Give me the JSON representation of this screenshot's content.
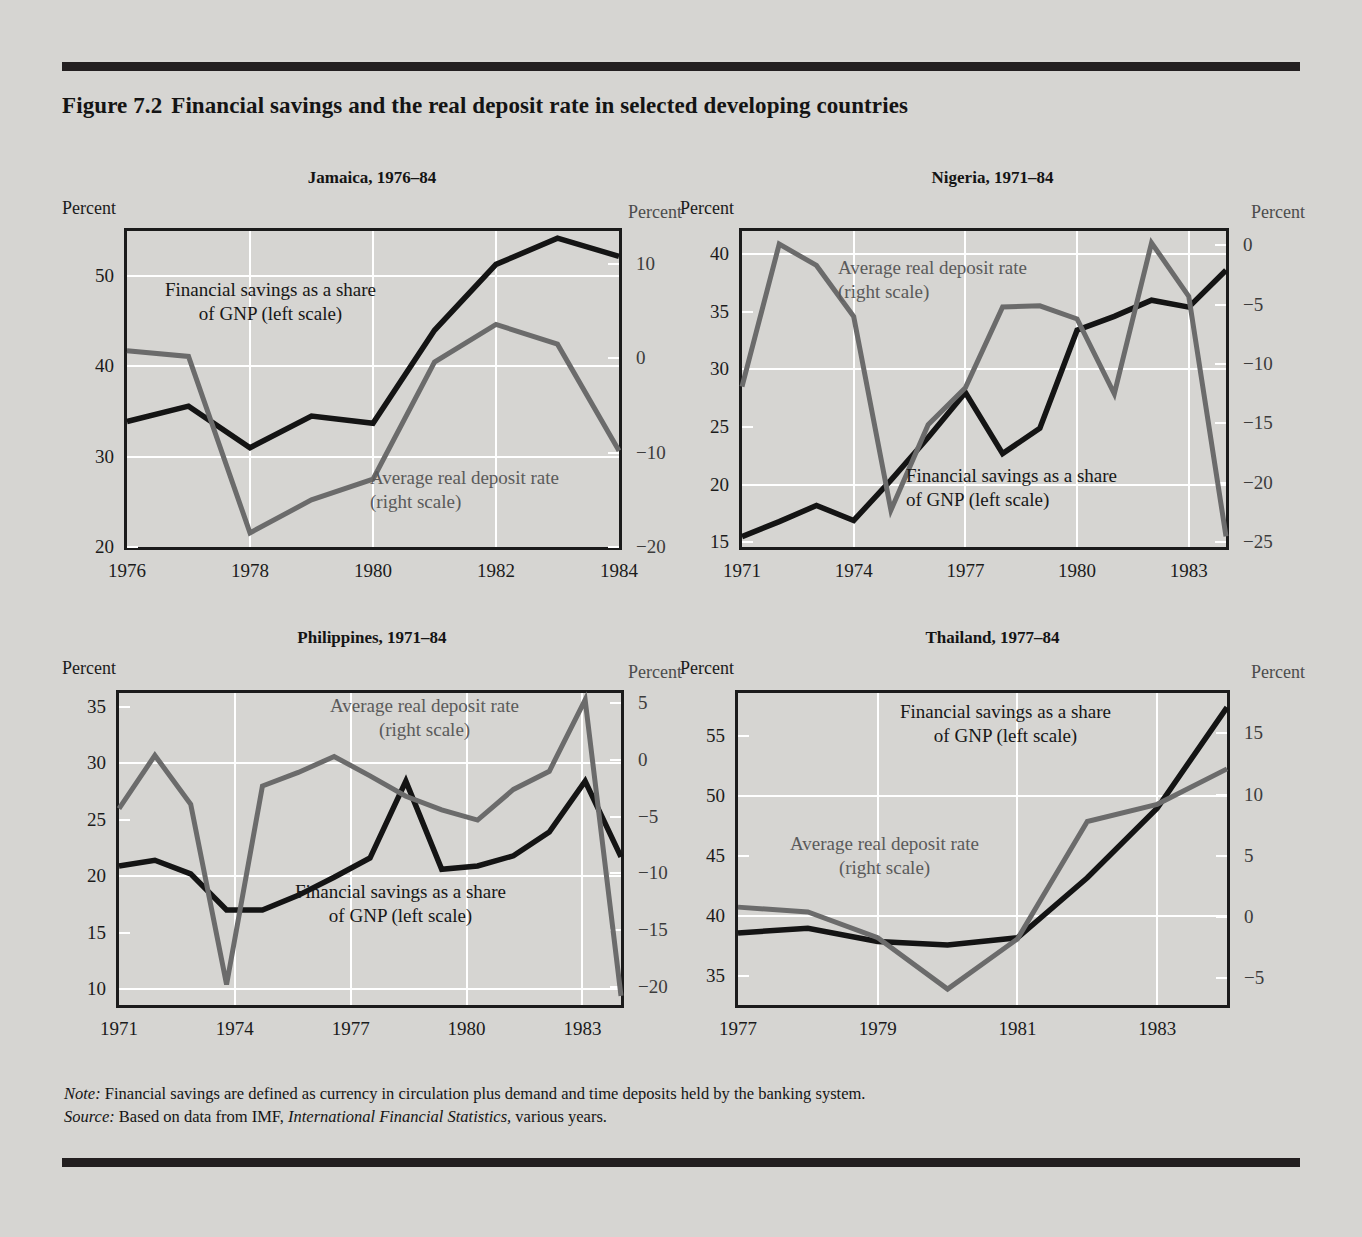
{
  "figure": {
    "number": "Figure 7.2",
    "title": "Financial savings and the real deposit rate in selected developing countries"
  },
  "axis_caption": {
    "left": "Percent",
    "right": "Percent"
  },
  "legend": {
    "savings_line1": "Financial savings as a share",
    "savings_line2": "of GNP (left scale)",
    "deposit_line1": "Average real deposit rate",
    "deposit_line2": "(right scale)"
  },
  "note": {
    "note_label": "Note:",
    "note_text": " Financial savings are defined as currency in circulation plus demand and time deposits held by the banking system.",
    "source_label": "Source:",
    "source_text_a": " Based on data from IMF, ",
    "source_italic": "International Financial Statistics,",
    "source_text_b": " various years."
  },
  "colors": {
    "background": "#d6d5d2",
    "savings_line": "#141414",
    "deposit_line": "#6b6b6b",
    "gridline": "#ffffff",
    "axis": "#1b1b1b"
  },
  "chart_data": [
    {
      "type": "line",
      "id": "jamaica",
      "title": "Jamaica, 1976–84",
      "xlabel": "",
      "ylabel": "Percent",
      "y2label": "Percent",
      "x": [
        1976,
        1977,
        1978,
        1979,
        1980,
        1981,
        1982,
        1983,
        1984
      ],
      "xlim": [
        1976,
        1984
      ],
      "xticks": [
        1976,
        1978,
        1980,
        1982,
        1984
      ],
      "xticklabels": [
        "1976",
        "1978",
        "1980",
        "1982",
        "1984"
      ],
      "ylim": [
        20,
        55
      ],
      "yticks": [
        20,
        30,
        40,
        50
      ],
      "yticklabels": [
        "20",
        "30",
        "40",
        "50"
      ],
      "ygrid": [
        30,
        40,
        50
      ],
      "y2lim": [
        -20,
        13.5
      ],
      "y2ticks": [
        -20,
        -10,
        0,
        10
      ],
      "y2ticklabels": [
        "−20",
        "−10",
        "0",
        "10"
      ],
      "grid": true,
      "series": [
        {
          "name": "Financial savings as a share of GNP (left scale)",
          "axis": "left",
          "color": "#141414",
          "values": [
            33.9,
            35.6,
            31.0,
            34.5,
            33.7,
            44.0,
            51.3,
            54.2,
            52.2
          ]
        },
        {
          "name": "Average real deposit rate (right scale)",
          "axis": "right",
          "color": "#6b6b6b",
          "values": [
            0.8,
            0.2,
            -18.5,
            -15.0,
            -12.8,
            -0.4,
            3.6,
            1.5,
            -9.8
          ]
        }
      ],
      "annotations": [
        {
          "text": "Financial savings as a share / of GNP (left scale)",
          "style": "dark"
        },
        {
          "text": "Average real deposit rate / (right scale)",
          "style": "gray"
        }
      ]
    },
    {
      "type": "line",
      "id": "nigeria",
      "title": "Nigeria, 1971–84",
      "xlabel": "",
      "ylabel": "Percent",
      "y2label": "Percent",
      "x": [
        1971,
        1972,
        1973,
        1974,
        1975,
        1976,
        1977,
        1978,
        1979,
        1980,
        1981,
        1982,
        1983,
        1984
      ],
      "xlim": [
        1971,
        1984
      ],
      "xticks": [
        1971,
        1974,
        1977,
        1980,
        1983
      ],
      "xticklabels": [
        "1971",
        "1974",
        "1977",
        "1980",
        "1983"
      ],
      "ylim": [
        14.6,
        42
      ],
      "yticks": [
        15,
        20,
        25,
        30,
        35,
        40
      ],
      "yticklabels": [
        "15",
        "20",
        "25",
        "30",
        "35",
        "40"
      ],
      "ygrid": [
        20,
        30,
        40
      ],
      "y2lim": [
        -25.4,
        1.2
      ],
      "y2ticks": [
        -25,
        -20,
        -15,
        -10,
        -5,
        0
      ],
      "y2ticklabels": [
        "−25",
        "−20",
        "−15",
        "−10",
        "−5",
        "0"
      ],
      "grid": true,
      "series": [
        {
          "name": "Financial savings as a share of GNP (left scale)",
          "axis": "left",
          "color": "#141414",
          "values": [
            15.5,
            16.8,
            18.2,
            16.9,
            20.4,
            24.1,
            28.0,
            22.7,
            24.9,
            33.4,
            34.6,
            36.0,
            35.4,
            38.6
          ]
        },
        {
          "name": "Average real deposit rate (right scale)",
          "axis": "right",
          "color": "#6b6b6b",
          "values": [
            -11.9,
            0.1,
            -1.7,
            -6.0,
            -22.3,
            -15.1,
            -12.0,
            -5.2,
            -5.1,
            -6.2,
            -12.5,
            0.2,
            -4.3,
            -24.5
          ]
        }
      ],
      "annotations": [
        {
          "text": "Average real deposit rate / (right scale)",
          "style": "gray"
        },
        {
          "text": "Financial savings as a share / of GNP (left scale)",
          "style": "dark"
        }
      ]
    },
    {
      "type": "line",
      "id": "philippines",
      "title": "Philippines, 1971–84",
      "xlabel": "",
      "ylabel": "Percent",
      "y2label": "Percent",
      "x": [
        1971,
        1972,
        1973,
        1974,
        1975,
        1976,
        1977,
        1978,
        1979,
        1980,
        1981,
        1982,
        1983,
        1984
      ],
      "xlim": [
        1971,
        1984
      ],
      "xticks": [
        1971,
        1974,
        1977,
        1980,
        1983
      ],
      "xticklabels": [
        "1971",
        "1974",
        "1977",
        "1980",
        "1983"
      ],
      "ylim": [
        8.6,
        36.2
      ],
      "yticks": [
        10,
        15,
        20,
        25,
        30,
        35
      ],
      "yticklabels": [
        "10",
        "15",
        "20",
        "25",
        "30",
        "35"
      ],
      "ygrid": [
        10,
        20,
        30
      ],
      "y2lim": [
        -21.6,
        5.9
      ],
      "y2ticks": [
        -20,
        -15,
        -10,
        -5,
        0,
        5
      ],
      "y2ticklabels": [
        "−20",
        "−15",
        "−10",
        "−5",
        "0",
        "5"
      ],
      "grid": true,
      "series": [
        {
          "name": "Financial savings as a share of GNP (left scale)",
          "axis": "left",
          "color": "#141414",
          "values": [
            20.9,
            21.4,
            20.2,
            17.0,
            17.0,
            18.3,
            19.9,
            21.6,
            28.4,
            20.6,
            20.9,
            21.8,
            23.9,
            28.4,
            21.7
          ]
        },
        {
          "name": "Average real deposit rate (right scale)",
          "axis": "right",
          "color": "#6b6b6b",
          "values": [
            -4.3,
            0.4,
            -3.9,
            -19.8,
            -2.3,
            -1.1,
            0.3,
            -1.4,
            -3.2,
            -4.4,
            -5.3,
            -2.6,
            -1.0,
            5.3,
            -20.8
          ]
        }
      ],
      "annotations": [
        {
          "text": "Average real deposit rate / (right scale)",
          "style": "gray"
        },
        {
          "text": "Financial savings as a share / of GNP (left scale)",
          "style": "dark"
        }
      ]
    },
    {
      "type": "line",
      "id": "thailand",
      "title": "Thailand, 1977–84",
      "xlabel": "",
      "ylabel": "Percent",
      "y2label": "Percent",
      "x": [
        1977,
        1978,
        1979,
        1980,
        1981,
        1982,
        1983,
        1984
      ],
      "xlim": [
        1977,
        1984
      ],
      "xticks": [
        1977,
        1979,
        1981,
        1983
      ],
      "xticklabels": [
        "1977",
        "1979",
        "1981",
        "1983"
      ],
      "ylim": [
        32.6,
        58.6
      ],
      "yticks": [
        35,
        40,
        45,
        50,
        55
      ],
      "yticklabels": [
        "35",
        "40",
        "45",
        "50",
        "55"
      ],
      "ygrid": [
        40,
        50
      ],
      "y2lim": [
        -7.2,
        18.3
      ],
      "y2ticks": [
        -5,
        0,
        5,
        10,
        15
      ],
      "y2ticklabels": [
        "−5",
        "0",
        "5",
        "10",
        "15"
      ],
      "grid": true,
      "series": [
        {
          "name": "Financial savings as a share of GNP (left scale)",
          "axis": "left",
          "color": "#141414",
          "values": [
            38.6,
            39.0,
            37.9,
            37.6,
            38.2,
            43.2,
            49.0,
            57.4
          ]
        },
        {
          "name": "Average real deposit rate (right scale)",
          "axis": "right",
          "color": "#6b6b6b",
          "values": [
            0.8,
            0.4,
            -1.7,
            -5.9,
            -1.8,
            7.8,
            9.2,
            12.1
          ]
        }
      ],
      "annotations": [
        {
          "text": "Financial savings as a share / of GNP (left scale)",
          "style": "dark"
        },
        {
          "text": "Average real deposit rate / (right scale)",
          "style": "gray"
        }
      ]
    }
  ]
}
